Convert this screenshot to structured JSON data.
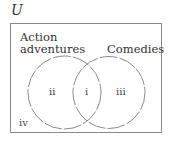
{
  "diagram": {
    "type": "venn",
    "universe_label": "U",
    "sets": [
      {
        "name": "Action adventures",
        "line1": "Action",
        "line2": "adventures"
      },
      {
        "name": "Comedies"
      }
    ],
    "regions": {
      "intersection": "i",
      "only_a": "ii",
      "only_b": "iii",
      "outside": "iv"
    },
    "colors": {
      "circle": "#8a8a8a",
      "border": "#8a8a8a",
      "text": "#333333"
    }
  }
}
